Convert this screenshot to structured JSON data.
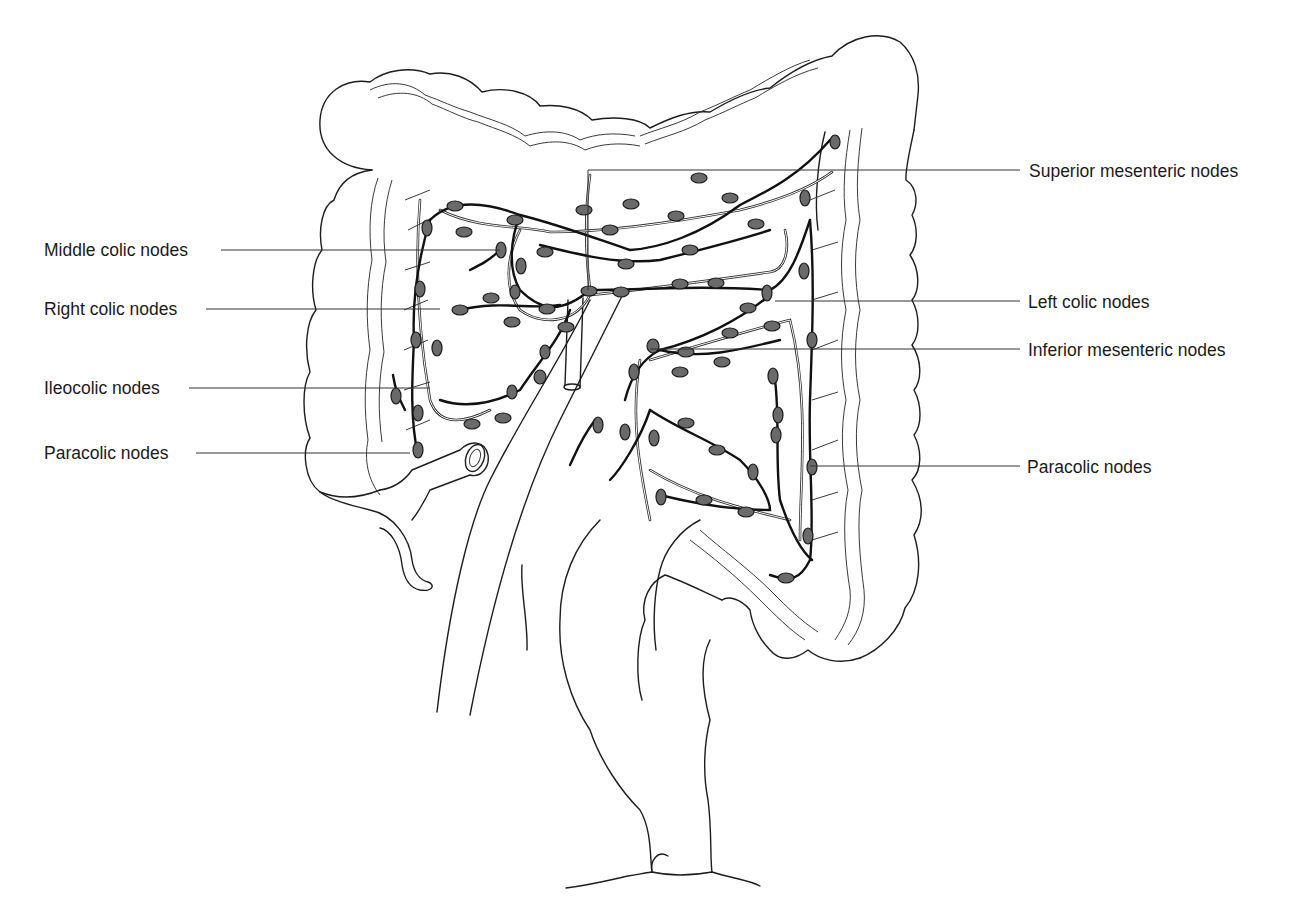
{
  "figure": {
    "labels_left": [
      {
        "id": "middle-colic",
        "text": "Middle colic nodes",
        "x": 44,
        "y": 240,
        "line_to": 500,
        "line_y": 250
      },
      {
        "id": "right-colic",
        "text": "Right colic nodes",
        "x": 44,
        "y": 299,
        "line_to": 440,
        "line_y": 309
      },
      {
        "id": "ileocolic",
        "text": "Ileocolic nodes",
        "x": 44,
        "y": 378,
        "line_to": 430,
        "line_y": 388
      },
      {
        "id": "paracolic-left",
        "text": "Paracolic nodes",
        "x": 44,
        "y": 443,
        "line_to": 410,
        "line_y": 453
      }
    ],
    "labels_right": [
      {
        "id": "superior-mesenteric",
        "text": "Superior mesenteric nodes",
        "x": 1029,
        "y": 162,
        "line_from": 588,
        "line_y": 170
      },
      {
        "id": "left-colic",
        "text": "Left colic nodes",
        "x": 1028,
        "y": 293,
        "line_from": 775,
        "line_y": 301
      },
      {
        "id": "inferior-mesenteric",
        "text": "Inferior mesenteric nodes",
        "x": 1028,
        "y": 341,
        "line_from": 650,
        "line_y": 349
      },
      {
        "id": "paracolic-right",
        "text": "Paracolic nodes",
        "x": 1027,
        "y": 458,
        "line_from": 810,
        "line_y": 466
      }
    ],
    "colors": {
      "line": "#1c1c1c",
      "node_fill": "#6a6a6a",
      "background": "#ffffff",
      "text": "#1a1a1a"
    }
  }
}
